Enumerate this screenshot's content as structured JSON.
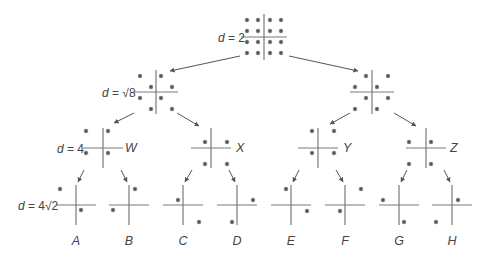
{
  "diagram": {
    "type": "binary-tree-constellation-partition",
    "levels": [
      {
        "distance_label": "d = 2",
        "d_var": "d",
        "d_value": "= 2",
        "label_pos": [
          218,
          42
        ]
      },
      {
        "distance_label": "d = √8",
        "d_var": "d",
        "d_value": "= √8",
        "label_pos": [
          102,
          97
        ]
      },
      {
        "distance_label": "d = 4",
        "d_var": "d",
        "d_value": "= 4",
        "label_pos": [
          57,
          153
        ]
      },
      {
        "distance_label": "d = 4√2",
        "d_var": "d",
        "d_value": "= 4√2",
        "label_pos": [
          18,
          210
        ]
      }
    ],
    "nodes": [
      {
        "id": "root",
        "level": 0,
        "cx": 264,
        "cy": 37,
        "hw": 23,
        "hh": 23,
        "dots": [
          [
            247,
            20
          ],
          [
            258,
            20
          ],
          [
            270,
            20
          ],
          [
            281,
            20
          ],
          [
            247,
            31
          ],
          [
            258,
            31
          ],
          [
            270,
            31
          ],
          [
            281,
            31
          ],
          [
            247,
            42
          ],
          [
            258,
            42
          ],
          [
            270,
            42
          ],
          [
            281,
            42
          ],
          [
            247,
            53
          ],
          [
            258,
            53
          ],
          [
            270,
            53
          ],
          [
            281,
            53
          ]
        ]
      },
      {
        "id": "L",
        "level": 1,
        "cx": 156,
        "cy": 92,
        "hw": 22,
        "hh": 22,
        "dots": [
          [
            140,
            76
          ],
          [
            161,
            76
          ],
          [
            151,
            87
          ],
          [
            172,
            87
          ],
          [
            140,
            98
          ],
          [
            161,
            98
          ],
          [
            151,
            109
          ],
          [
            172,
            109
          ]
        ]
      },
      {
        "id": "R",
        "level": 1,
        "cx": 372,
        "cy": 92,
        "hw": 22,
        "hh": 22,
        "dots": [
          [
            366,
            76
          ],
          [
            388,
            76
          ],
          [
            355,
            87
          ],
          [
            377,
            87
          ],
          [
            366,
            98
          ],
          [
            388,
            98
          ],
          [
            355,
            109
          ],
          [
            377,
            109
          ]
        ]
      },
      {
        "id": "W",
        "level": 2,
        "cx": 103,
        "cy": 148,
        "hw": 20,
        "hh": 20,
        "name": "W",
        "dots": [
          [
            86,
            131
          ],
          [
            108,
            131
          ],
          [
            86,
            153
          ],
          [
            108,
            153
          ]
        ]
      },
      {
        "id": "X",
        "level": 2,
        "cx": 211,
        "cy": 148,
        "hw": 20,
        "hh": 20,
        "name": "X",
        "dots": [
          [
            205,
            142
          ],
          [
            227,
            142
          ],
          [
            205,
            164
          ],
          [
            227,
            164
          ]
        ]
      },
      {
        "id": "Y",
        "level": 2,
        "cx": 318,
        "cy": 148,
        "hw": 20,
        "hh": 20,
        "name": "Y",
        "dots": [
          [
            312,
            131
          ],
          [
            334,
            131
          ],
          [
            312,
            153
          ],
          [
            334,
            153
          ]
        ]
      },
      {
        "id": "Z",
        "level": 2,
        "cx": 426,
        "cy": 148,
        "hw": 20,
        "hh": 20,
        "name": "Z",
        "dots": [
          [
            409,
            142
          ],
          [
            431,
            142
          ],
          [
            409,
            164
          ],
          [
            431,
            164
          ]
        ]
      },
      {
        "id": "A",
        "level": 3,
        "cx": 76,
        "cy": 205,
        "hw": 20,
        "hh": 20,
        "name": "A",
        "dots": [
          [
            60,
            189
          ],
          [
            81,
            210
          ]
        ]
      },
      {
        "id": "B",
        "level": 3,
        "cx": 129,
        "cy": 205,
        "hw": 20,
        "hh": 20,
        "name": "B",
        "dots": [
          [
            135,
            189
          ],
          [
            113,
            210
          ]
        ]
      },
      {
        "id": "C",
        "level": 3,
        "cx": 183,
        "cy": 205,
        "hw": 20,
        "hh": 20,
        "name": "C",
        "dots": [
          [
            178,
            200
          ],
          [
            199,
            222
          ]
        ]
      },
      {
        "id": "D",
        "level": 3,
        "cx": 237,
        "cy": 205,
        "hw": 20,
        "hh": 20,
        "name": "D",
        "dots": [
          [
            253,
            200
          ],
          [
            232,
            222
          ]
        ]
      },
      {
        "id": "E",
        "level": 3,
        "cx": 291,
        "cy": 205,
        "hw": 20,
        "hh": 20,
        "name": "E",
        "dots": [
          [
            286,
            189
          ],
          [
            307,
            211
          ]
        ]
      },
      {
        "id": "F",
        "level": 3,
        "cx": 345,
        "cy": 205,
        "hw": 20,
        "hh": 20,
        "name": "F",
        "dots": [
          [
            361,
            189
          ],
          [
            340,
            211
          ]
        ]
      },
      {
        "id": "G",
        "level": 3,
        "cx": 399,
        "cy": 205,
        "hw": 20,
        "hh": 20,
        "name": "G",
        "dots": [
          [
            383,
            200
          ],
          [
            404,
            222
          ]
        ]
      },
      {
        "id": "H",
        "level": 3,
        "cx": 452,
        "cy": 205,
        "hw": 20,
        "hh": 20,
        "name": "H",
        "dots": [
          [
            458,
            200
          ],
          [
            436,
            222
          ]
        ]
      }
    ],
    "edges": [
      {
        "from": "root",
        "to": "L",
        "x1": 240,
        "y1": 56,
        "x2": 170,
        "y2": 71
      },
      {
        "from": "root",
        "to": "R",
        "x1": 289,
        "y1": 56,
        "x2": 358,
        "y2": 71
      },
      {
        "from": "L",
        "to": "W",
        "x1": 134,
        "y1": 113,
        "x2": 114,
        "y2": 123
      },
      {
        "from": "L",
        "to": "X",
        "x1": 177,
        "y1": 113,
        "x2": 199,
        "y2": 126
      },
      {
        "from": "R",
        "to": "Y",
        "x1": 350,
        "y1": 113,
        "x2": 330,
        "y2": 124
      },
      {
        "from": "R",
        "to": "Z",
        "x1": 394,
        "y1": 113,
        "x2": 416,
        "y2": 126
      },
      {
        "from": "W",
        "to": "A",
        "x1": 84,
        "y1": 170,
        "x2": 78,
        "y2": 182
      },
      {
        "from": "W",
        "to": "B",
        "x1": 121,
        "y1": 170,
        "x2": 127,
        "y2": 182
      },
      {
        "from": "X",
        "to": "C",
        "x1": 192,
        "y1": 170,
        "x2": 185,
        "y2": 182
      },
      {
        "from": "X",
        "to": "D",
        "x1": 229,
        "y1": 170,
        "x2": 235,
        "y2": 182
      },
      {
        "from": "Y",
        "to": "E",
        "x1": 299,
        "y1": 170,
        "x2": 293,
        "y2": 182
      },
      {
        "from": "Y",
        "to": "F",
        "x1": 336,
        "y1": 170,
        "x2": 343,
        "y2": 182
      },
      {
        "from": "Z",
        "to": "G",
        "x1": 407,
        "y1": 170,
        "x2": 401,
        "y2": 182
      },
      {
        "from": "Z",
        "to": "H",
        "x1": 444,
        "y1": 170,
        "x2": 450,
        "y2": 182
      }
    ],
    "subset_labels": {
      "level2": [
        {
          "text": "W",
          "x": 125,
          "y": 152
        },
        {
          "text": "X",
          "x": 236,
          "y": 152
        },
        {
          "text": "Y",
          "x": 343,
          "y": 152
        },
        {
          "text": "Z",
          "x": 450,
          "y": 152
        }
      ],
      "level3": [
        {
          "text": "A",
          "x": 76,
          "y": 245
        },
        {
          "text": "B",
          "x": 129,
          "y": 245
        },
        {
          "text": "C",
          "x": 183,
          "y": 245
        },
        {
          "text": "D",
          "x": 237,
          "y": 245
        },
        {
          "text": "E",
          "x": 291,
          "y": 245
        },
        {
          "text": "F",
          "x": 345,
          "y": 245
        },
        {
          "text": "G",
          "x": 399,
          "y": 245
        },
        {
          "text": "H",
          "x": 452,
          "y": 245
        }
      ]
    },
    "colors": {
      "axis": "#7a7a7a",
      "dot": "#555555",
      "arrow": "#555555",
      "text": "#444444",
      "background": "#ffffff"
    }
  }
}
